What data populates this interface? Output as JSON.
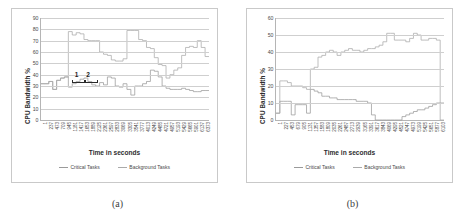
{
  "figure": {
    "panels": [
      {
        "caption": "(a)",
        "axis": {
          "ylabel": "CPU Bandwidth %",
          "xlabel": "Time in seconds",
          "yticks": [
            0,
            10,
            20,
            30,
            40,
            50,
            60,
            70,
            80,
            90
          ],
          "ylim": [
            0,
            90
          ],
          "xticks": [
            1,
            237,
            473,
            709,
            945,
            1181,
            1417,
            1653,
            1889,
            2125,
            2361,
            2597,
            2833,
            3069,
            3305,
            3541,
            3777,
            4013,
            4249,
            4485,
            4721,
            4957,
            5193,
            5429,
            5665,
            5901,
            6137,
            6373
          ]
        },
        "legend": [
          {
            "label": "Critical Tasks",
            "color": "#9a9a9a"
          },
          {
            "label": "Background Tasks",
            "color": "#aaaaaa"
          }
        ],
        "annotations": [
          {
            "text": "1"
          },
          {
            "text": "2"
          }
        ]
      },
      {
        "caption": "(b)",
        "axis": {
          "ylabel": "CPU Bandwidth %",
          "xlabel": "Time in seconds",
          "yticks": [
            0,
            10,
            20,
            30,
            40,
            50,
            60
          ],
          "ylim": [
            0,
            60
          ],
          "xticks": [
            1,
            227,
            453,
            679,
            905,
            1131,
            1357,
            1583,
            1809,
            2035,
            2261,
            2487,
            2713,
            2939,
            3165,
            3391,
            3617,
            3843,
            4069,
            4295,
            4521,
            4747,
            4973,
            5199,
            5425,
            5651,
            5877,
            6103
          ]
        },
        "legend": [
          {
            "label": "Critical Tasks",
            "color": "#9a9a9a"
          },
          {
            "label": "Background Tasks",
            "color": "#aaaaaa"
          }
        ],
        "annotations": []
      }
    ]
  },
  "chart_data": [
    {
      "type": "line",
      "title": "(a)",
      "xlabel": "Time in seconds",
      "ylabel": "CPU Bandwidth %",
      "ylim": [
        0,
        90
      ],
      "xlim": [
        1,
        6490
      ],
      "grid": true,
      "legend_position": "bottom",
      "step": true,
      "categories": [
        1,
        237,
        473,
        709,
        945,
        1181,
        1417,
        1653,
        1889,
        2125,
        2361,
        2597,
        2833,
        3069,
        3305,
        3541,
        3777,
        4013,
        4249,
        4485,
        4721,
        4957,
        5193,
        5429,
        5665,
        5901,
        6137,
        6373
      ],
      "series": [
        {
          "name": "Critical Tasks",
          "color": "#9a9a9a",
          "values": [
            32,
            32,
            34,
            27,
            35,
            37,
            38,
            29,
            32,
            34,
            36,
            37,
            34,
            31,
            30,
            33,
            31,
            38,
            37,
            30,
            29,
            32,
            27,
            22,
            30,
            30,
            32,
            34,
            44,
            43,
            38,
            30,
            28,
            27,
            27,
            27,
            28,
            27,
            26,
            25,
            25,
            26,
            26
          ]
        },
        {
          "name": "Background Tasks",
          "color": "#aaaaaa",
          "values": [
            32,
            32,
            34,
            27,
            35,
            37,
            38,
            78,
            75,
            77,
            76,
            71,
            70,
            70,
            70,
            60,
            58,
            57,
            53,
            52,
            52,
            54,
            79,
            79,
            79,
            71,
            70,
            64,
            63,
            55,
            49,
            48,
            37,
            40,
            44,
            46,
            57,
            64,
            65,
            64,
            70,
            64,
            56
          ]
        }
      ],
      "annotations": [
        {
          "text": "1",
          "x": 1300,
          "y": 43
        },
        {
          "text": "2",
          "x": 1750,
          "y": 43
        }
      ]
    },
    {
      "type": "line",
      "title": "(b)",
      "xlabel": "Time in seconds",
      "ylabel": "CPU Bandwidth %",
      "ylim": [
        0,
        60
      ],
      "xlim": [
        1,
        6210
      ],
      "grid": true,
      "legend_position": "bottom",
      "step": true,
      "categories": [
        1,
        227,
        453,
        679,
        905,
        1131,
        1357,
        1583,
        1809,
        2035,
        2261,
        2487,
        2713,
        2939,
        3165,
        3391,
        3617,
        3843,
        4069,
        4295,
        4521,
        4747,
        4973,
        5199,
        5425,
        5651,
        5877,
        6103
      ],
      "series": [
        {
          "name": "Critical Tasks",
          "color": "#9a9a9a",
          "values": [
            4,
            11,
            11,
            11,
            3,
            9,
            9,
            9,
            4,
            18,
            17,
            16,
            14,
            14,
            13,
            13,
            12,
            12,
            12,
            12,
            12,
            11,
            11,
            11,
            10,
            3,
            0,
            0,
            0,
            0,
            0,
            0,
            0,
            2,
            3,
            4,
            5,
            6,
            6,
            7,
            8,
            9,
            10,
            10
          ]
        },
        {
          "name": "Background Tasks",
          "color": "#aaaaaa",
          "values": [
            4,
            23,
            23,
            22,
            20,
            20,
            20,
            19,
            18,
            30,
            31,
            37,
            38,
            40,
            41,
            40,
            38,
            40,
            41,
            42,
            41,
            41,
            40,
            41,
            42,
            42,
            43,
            44,
            46,
            51,
            51,
            47,
            47,
            47,
            46,
            48,
            51,
            50,
            47,
            47,
            48,
            48,
            47,
            0
          ]
        }
      ],
      "annotations": []
    }
  ]
}
